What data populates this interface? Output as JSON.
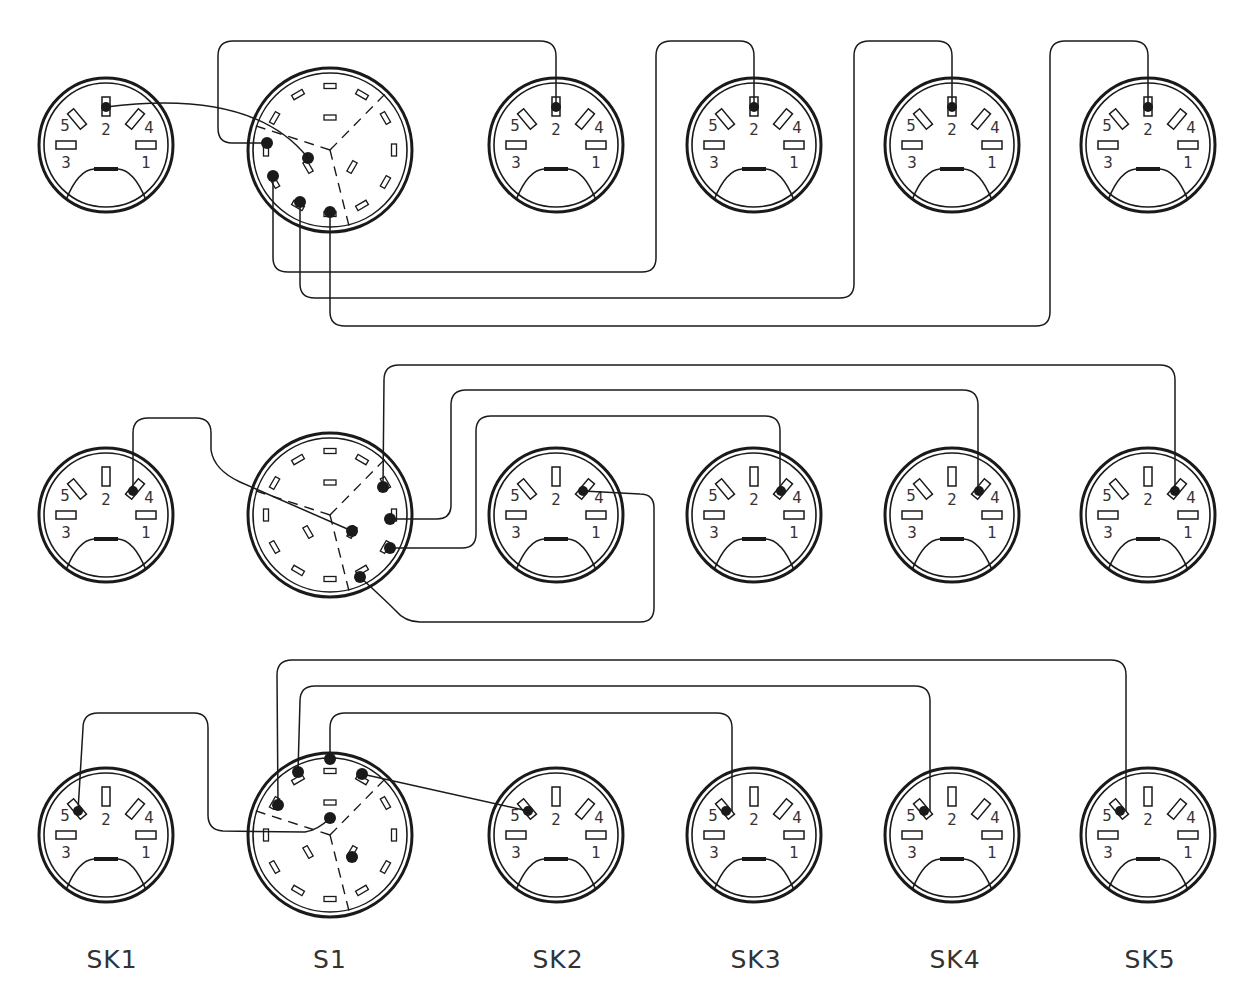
{
  "diagram": {
    "stroke_color": "#1a1a1a",
    "background": "#ffffff",
    "columns": [
      {
        "id": "SK1",
        "label": "SK1",
        "x": 106,
        "kind": "din-socket"
      },
      {
        "id": "S1",
        "label": "S1",
        "x": 330,
        "kind": "rotary-switch"
      },
      {
        "id": "SK2",
        "label": "SK2",
        "x": 556,
        "kind": "din-socket"
      },
      {
        "id": "SK3",
        "label": "SK3",
        "x": 754,
        "kind": "din-socket"
      },
      {
        "id": "SK4",
        "label": "SK4",
        "x": 952,
        "kind": "din-socket"
      },
      {
        "id": "SK5",
        "label": "SK5",
        "x": 1148,
        "kind": "din-socket"
      }
    ],
    "rows": [
      {
        "name": "row-pin-2",
        "y": 145,
        "switch_y": 150,
        "active_pin": "2"
      },
      {
        "name": "row-pin-4",
        "y": 515,
        "switch_y": 515,
        "active_pin": "4"
      },
      {
        "name": "row-pin-5",
        "y": 835,
        "switch_y": 835,
        "active_pin": "5"
      }
    ],
    "pin_labels": [
      "1",
      "2",
      "3",
      "4",
      "5"
    ],
    "column_labels_y": 960
  }
}
